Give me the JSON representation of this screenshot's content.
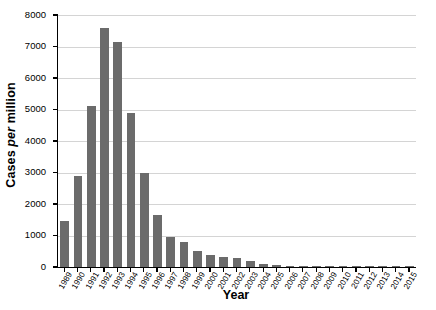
{
  "chart_data": {
    "type": "bar",
    "title": "",
    "xlabel": "Year",
    "ylabel_prefix": "Cases ",
    "ylabel_italic": "per",
    "ylabel_suffix": " million",
    "ylabel_full": "Cases per million",
    "ylim": [
      0,
      8000
    ],
    "ytick_labels": [
      "8000",
      "7000",
      "6000",
      "5000",
      "4000",
      "3000",
      "2000",
      "1000",
      "0"
    ],
    "ytick_values": [
      8000,
      7000,
      6000,
      5000,
      4000,
      3000,
      2000,
      1000,
      0
    ],
    "grid": true,
    "legend": "none",
    "bar_color": "#6b6b6b",
    "grid_color": "#d4d4d4",
    "axis_color": "#000000",
    "categories": [
      "1989",
      "1990",
      "1991",
      "1992",
      "1993",
      "1994",
      "1995",
      "1996",
      "1997",
      "1998",
      "1999",
      "2000",
      "2001",
      "2002",
      "2003",
      "2004",
      "2005",
      "2006",
      "2007",
      "2008",
      "2009",
      "2010",
      "2011",
      "2012",
      "2013",
      "2014",
      "2015"
    ],
    "values": [
      1450,
      2880,
      5120,
      7600,
      7150,
      4880,
      2980,
      1650,
      950,
      780,
      500,
      390,
      330,
      290,
      200,
      110,
      60,
      30,
      20,
      15,
      12,
      10,
      10,
      8,
      8,
      6,
      6
    ]
  }
}
